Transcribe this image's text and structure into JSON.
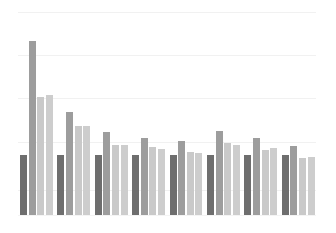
{
  "chart_data": {
    "type": "bar",
    "title": "",
    "subtitle": "",
    "xlabel": "",
    "ylabel": "",
    "grid": true,
    "legend": "none",
    "axis_labels_visible": false,
    "tick_labels_visible": false,
    "orientation": "vertical",
    "grouping": "grouped",
    "ylim": [
      0,
      100
    ],
    "gridline_values": [
      100,
      79,
      58,
      36,
      12
    ],
    "categories": [
      "G1",
      "G2",
      "G3",
      "G4",
      "G5",
      "G6",
      "G7",
      "G8"
    ],
    "series": [
      {
        "name": "Series 1",
        "color": "#6e6e6e",
        "values": [
          29,
          29,
          29,
          29,
          29,
          29,
          29,
          29
        ]
      },
      {
        "name": "Series 2",
        "color": "#9d9d9d",
        "values": [
          85,
          50,
          40,
          38,
          36,
          41,
          38,
          34
        ]
      },
      {
        "name": "Series 3",
        "color": "#c9c9c9",
        "values": [
          58,
          43,
          34,
          33,
          31,
          35,
          32,
          28
        ]
      },
      {
        "name": "Series 4",
        "color": "#cdcdcd",
        "values": [
          59,
          43,
          34,
          32,
          30,
          34,
          33,
          28
        ]
      }
    ]
  },
  "layout": {
    "plot_left": 18,
    "plot_right": 316,
    "plot_top": 10,
    "baseline_y": 215,
    "group_width": 37.4,
    "bar_width": 7,
    "bar_gap": 1.6,
    "pixel_top_values": [
      [
        155,
        41,
        97,
        95
      ],
      [
        155,
        112,
        126,
        126
      ],
      [
        155,
        132,
        145,
        145
      ],
      [
        155,
        138,
        147,
        149
      ],
      [
        155,
        141,
        152,
        153
      ],
      [
        155,
        131,
        143,
        145
      ],
      [
        155,
        138,
        150,
        148
      ],
      [
        155,
        146,
        158,
        157
      ]
    ],
    "gridline_pixel_y": [
      12,
      55,
      98,
      142,
      190
    ],
    "background_color": "#ffffff",
    "gridline_color": "#f1f1f1"
  }
}
